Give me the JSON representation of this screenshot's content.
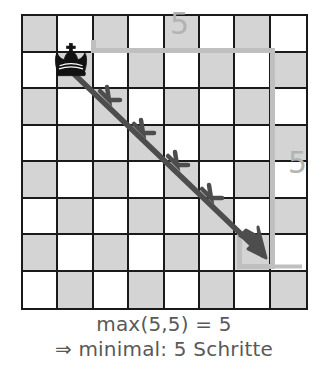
{
  "figure": {
    "kind": "chessboard-distance-diagram",
    "board": {
      "columns": 8,
      "rows": 8,
      "dark_color": "#d4d4d4",
      "light_color": "#ffffff",
      "border_color": "#1a1a1a"
    },
    "piece": {
      "name": "queen-crown-piece",
      "glyph": "♛",
      "color": "#121212",
      "column": 1,
      "row": 1
    },
    "move_arrow": {
      "name": "diagonal-move-arrow",
      "color": "#4d4d4d",
      "from_column": 1,
      "from_row": 1,
      "to_column": 6,
      "to_row": 6,
      "steps": 5,
      "chevrons": 5
    },
    "path_guide": {
      "name": "manhattan-path-guide",
      "color": "#bfbfbf",
      "horizontal_steps": 5,
      "vertical_steps": 5
    },
    "distance_labels": {
      "top": "5",
      "right": "5",
      "color": "#b3b3b3"
    },
    "caption": {
      "line1": "max(5,5) = 5",
      "line2": "⇒ minimal: 5 Schritte",
      "color": "#595959"
    }
  }
}
